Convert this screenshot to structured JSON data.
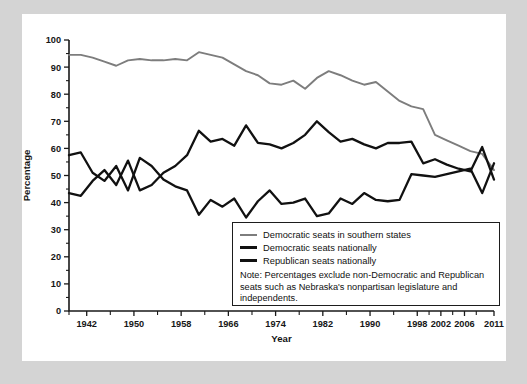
{
  "chart_data": {
    "type": "line",
    "title": "",
    "xlabel": "Year",
    "ylabel": "Percentage",
    "ylim": [
      0,
      100
    ],
    "xlim": [
      1939,
      2011
    ],
    "grid": false,
    "legend_position": "inside-bottom-right",
    "y_ticks": [
      0,
      10,
      20,
      30,
      40,
      50,
      60,
      70,
      80,
      90,
      100
    ],
    "x_ticks": [
      1942,
      1950,
      1958,
      1966,
      1974,
      1982,
      1990,
      1998,
      2002,
      2006,
      2011
    ],
    "x_tick_labels": [
      "1942",
      "1950",
      "1958",
      "1966",
      "1974",
      "1982",
      "1990",
      "1998",
      "2002",
      "2006",
      "2011"
    ],
    "x_minor_ticks": [
      1939,
      1946,
      1954,
      1962,
      1970,
      1978,
      1986,
      1994,
      2000,
      2004,
      2008
    ],
    "note": "Note: Percentages exclude non-Democratic and Republican seats such as Nebraska's nonpartisan legislature and independents.",
    "series": [
      {
        "name": "Democratic seats in southern states",
        "color": "#7d7d7d",
        "x": [
          1939,
          1941,
          1943,
          1945,
          1947,
          1949,
          1951,
          1953,
          1955,
          1957,
          1959,
          1961,
          1963,
          1965,
          1967,
          1969,
          1971,
          1973,
          1975,
          1977,
          1979,
          1981,
          1983,
          1985,
          1987,
          1989,
          1991,
          1993,
          1995,
          1997,
          1999,
          2001,
          2003,
          2005,
          2007,
          2009,
          2011
        ],
        "values": [
          94.5,
          94.5,
          93.5,
          92.0,
          90.5,
          92.5,
          93.0,
          92.5,
          92.5,
          93.0,
          92.5,
          95.5,
          94.5,
          93.5,
          91.0,
          88.5,
          87.0,
          84.0,
          83.5,
          85.0,
          82.0,
          86.0,
          88.5,
          87.0,
          85.0,
          83.5,
          84.5,
          81.0,
          77.5,
          75.5,
          74.5,
          65.0,
          63.0,
          61.0,
          59.0,
          58.0,
          52.0
        ]
      },
      {
        "name": "Democratic seats nationally",
        "color": "#111111",
        "x": [
          1939,
          1941,
          1943,
          1945,
          1947,
          1949,
          1951,
          1953,
          1955,
          1957,
          1959,
          1961,
          1963,
          1965,
          1967,
          1969,
          1971,
          1973,
          1975,
          1977,
          1979,
          1981,
          1983,
          1985,
          1987,
          1989,
          1991,
          1993,
          1995,
          1997,
          1999,
          2001,
          2003,
          2005,
          2007,
          2009,
          2011
        ],
        "values": [
          43.5,
          42.5,
          48.0,
          52.0,
          46.5,
          55.5,
          44.5,
          46.5,
          51.0,
          53.5,
          57.5,
          66.5,
          62.5,
          63.5,
          61.0,
          68.5,
          62.0,
          61.5,
          60.0,
          62.0,
          65.0,
          70.0,
          66.0,
          62.5,
          63.5,
          61.5,
          60.0,
          62.0,
          62.0,
          62.5,
          54.5,
          56.0,
          54.0,
          52.5,
          51.5,
          60.5,
          48.5
        ]
      },
      {
        "name": "Republican seats nationally",
        "color": "#111111",
        "x": [
          1939,
          1941,
          1943,
          1945,
          1947,
          1949,
          1951,
          1953,
          1955,
          1957,
          1959,
          1961,
          1963,
          1965,
          1967,
          1969,
          1971,
          1973,
          1975,
          1977,
          1979,
          1981,
          1983,
          1985,
          1987,
          1989,
          1991,
          1993,
          1995,
          1997,
          1999,
          2001,
          2003,
          2005,
          2007,
          2009,
          2011
        ],
        "values": [
          57.5,
          58.5,
          51.0,
          48.0,
          53.5,
          44.5,
          56.5,
          53.5,
          48.5,
          46.0,
          44.5,
          35.5,
          41.0,
          38.5,
          41.5,
          34.5,
          40.5,
          44.5,
          39.5,
          40.0,
          41.5,
          35.0,
          36.0,
          41.5,
          39.5,
          43.5,
          41.0,
          40.5,
          41.0,
          50.5,
          50.0,
          49.5,
          50.5,
          51.5,
          52.5,
          43.5,
          54.5
        ]
      }
    ]
  },
  "legend": {
    "items": [
      {
        "label": "Democratic seats in southern states",
        "swatch": "gray"
      },
      {
        "label": "Democratic seats nationally",
        "swatch": "black"
      },
      {
        "label": "Republican seats nationally",
        "swatch": "black"
      }
    ],
    "note": "Note: Percentages exclude non-Democratic and Republican seats such as Nebraska's nonpartisan legislature and independents."
  }
}
